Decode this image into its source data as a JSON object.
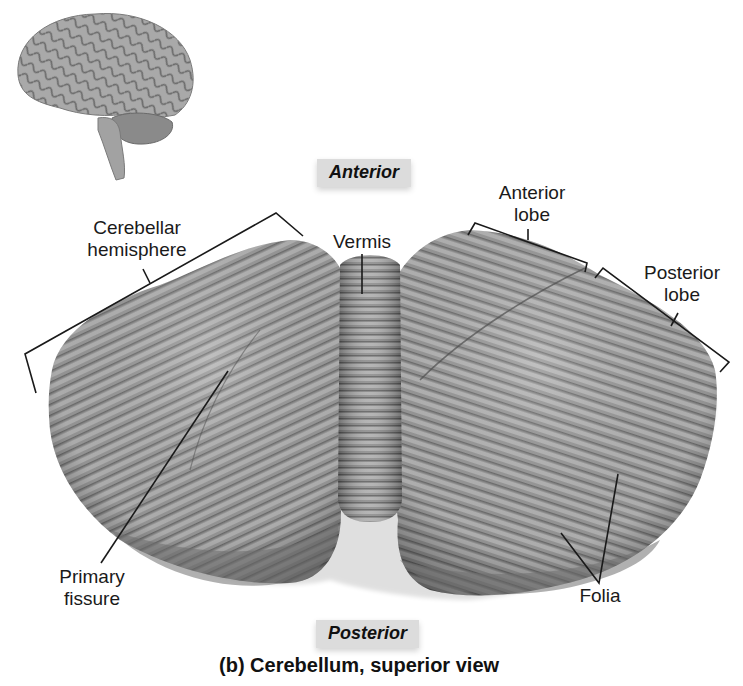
{
  "figure": {
    "caption": "(b) Cerebellum, superior view",
    "orientation": {
      "top": "Anterior",
      "bottom": "Posterior"
    },
    "inset": {
      "name": "brain-lateral-view",
      "description": "Whole brain, lateral view with cerebellum highlighted"
    },
    "labels": {
      "cerebellar_hemisphere": [
        "Cerebellar",
        "hemisphere"
      ],
      "vermis": "Vermis",
      "anterior_lobe": [
        "Anterior",
        "lobe"
      ],
      "posterior_lobe": [
        "Posterior",
        "lobe"
      ],
      "primary_fissure": [
        "Primary",
        "fissure"
      ],
      "folia": "Folia"
    },
    "colors": {
      "tissue_light": "#b5b5b5",
      "tissue_mid": "#8f8f8f",
      "tissue_dark": "#5e5e5e",
      "label_box": "#dcdcdc",
      "leader_line": "#1a1a1a"
    }
  }
}
